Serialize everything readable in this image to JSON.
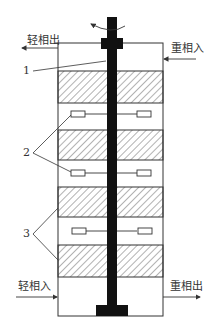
{
  "diagram": {
    "type": "rotating-disc extraction column schematic",
    "streams": {
      "light_out": "轻相出",
      "heavy_in": "重相入",
      "light_in": "轻相入",
      "heavy_out": "重相出"
    },
    "callouts": {
      "c1": "1",
      "c2": "2",
      "c3": "3"
    },
    "colors": {
      "line": "#333333",
      "shaft": "#111111",
      "hatch": "#555555",
      "background": "#ffffff"
    },
    "sections": [
      {
        "kind": "clear",
        "top": 43,
        "bottom": 71
      },
      {
        "kind": "hatched",
        "top": 71,
        "bottom": 103
      },
      {
        "kind": "impeller",
        "top": 103,
        "bottom": 130
      },
      {
        "kind": "hatched",
        "top": 130,
        "bottom": 160
      },
      {
        "kind": "impeller",
        "top": 160,
        "bottom": 187
      },
      {
        "kind": "hatched",
        "top": 187,
        "bottom": 217
      },
      {
        "kind": "impeller",
        "top": 217,
        "bottom": 245
      },
      {
        "kind": "hatched",
        "top": 245,
        "bottom": 277
      },
      {
        "kind": "clear",
        "top": 277,
        "bottom": 316
      }
    ]
  }
}
